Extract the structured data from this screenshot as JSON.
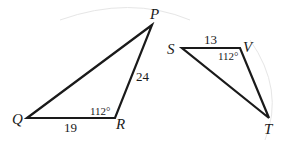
{
  "figure": {
    "background": "#ffffff",
    "line_color": "#1a1a1a",
    "triangles": [
      {
        "name": "PQR",
        "vertices": {
          "P": {
            "label": "P",
            "x": 152,
            "y": 25
          },
          "Q": {
            "label": "Q",
            "x": 27,
            "y": 118
          },
          "R": {
            "label": "R",
            "x": 115,
            "y": 118
          }
        },
        "sides": {
          "QR": "19",
          "RP": "24"
        },
        "angle_R": "112°"
      },
      {
        "name": "SVT",
        "vertices": {
          "S": {
            "label": "S",
            "x": 182,
            "y": 48
          },
          "V": {
            "label": "V",
            "x": 240,
            "y": 48
          },
          "T": {
            "label": "T",
            "x": 269,
            "y": 118
          }
        },
        "sides": {
          "SV": "13"
        },
        "angle_V": "112°"
      }
    ]
  }
}
